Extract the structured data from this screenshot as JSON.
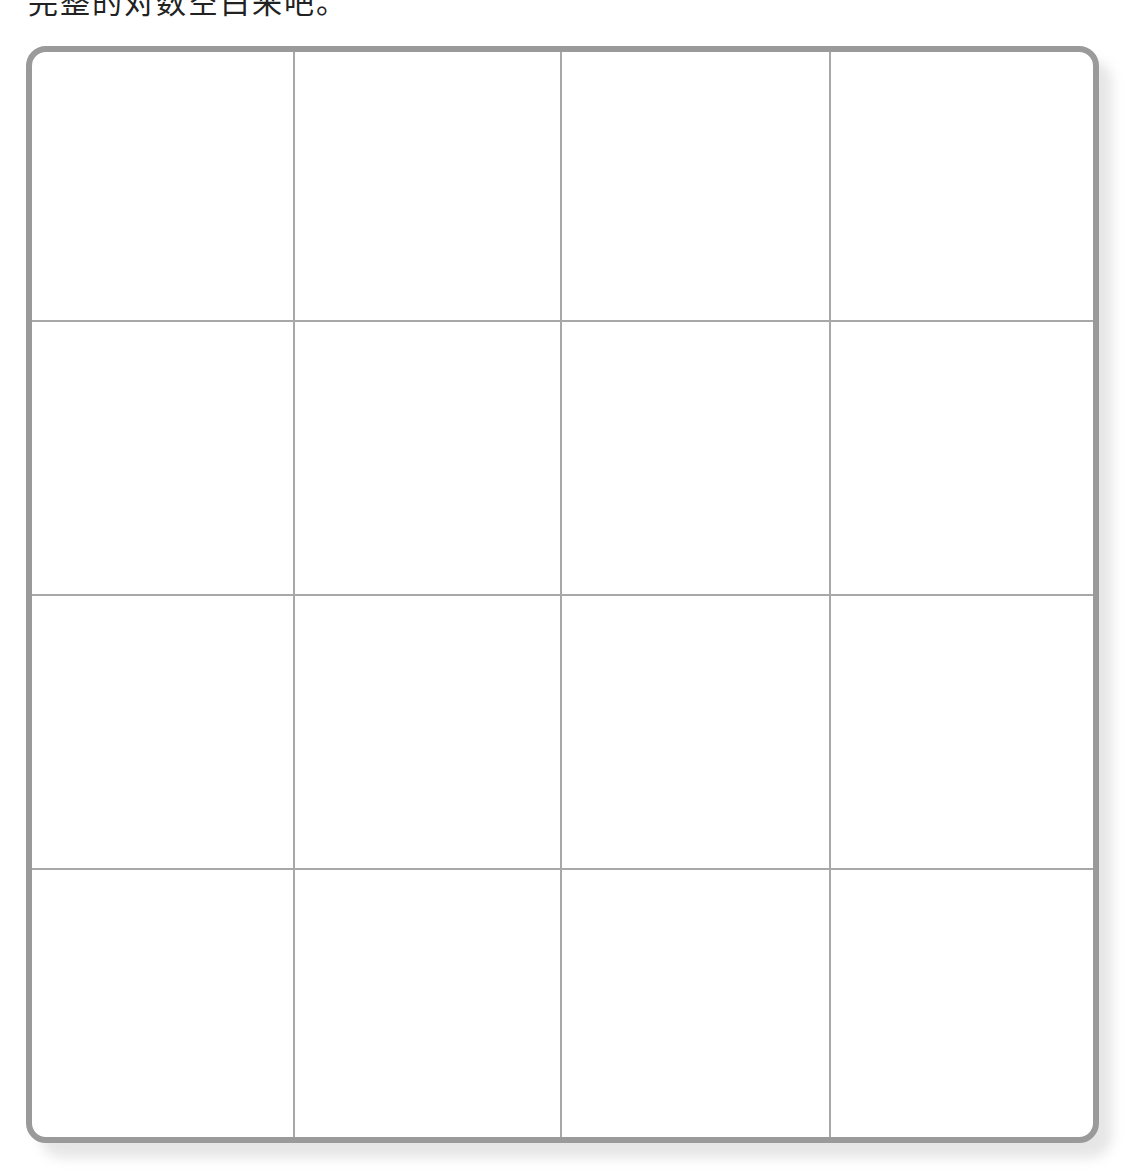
{
  "caption": {
    "text": "完整的对数空白来吧。",
    "note": "text clipped at top edge; only lower strokes visible"
  },
  "grid": {
    "rows": 4,
    "columns": 4,
    "line_color": "#a8a8a8",
    "border_color": "#9a9a9a",
    "cells": [
      [
        "",
        "",
        "",
        ""
      ],
      [
        "",
        "",
        "",
        ""
      ],
      [
        "",
        "",
        "",
        ""
      ],
      [
        "",
        "",
        "",
        ""
      ]
    ]
  }
}
